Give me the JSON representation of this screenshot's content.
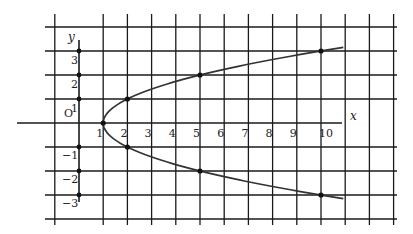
{
  "chart_data": {
    "type": "line",
    "title": "",
    "equation": "x = y^2 + 1",
    "xlabel": "x",
    "ylabel": "y",
    "origin_label": "O",
    "xlim": [
      -1,
      13
    ],
    "ylim": [
      -4,
      4
    ],
    "grid": true,
    "x_ticks": [
      1,
      2,
      3,
      4,
      5,
      6,
      7,
      8,
      9,
      10
    ],
    "x_tick_labels": [
      "1",
      "2",
      "3",
      "4",
      "5",
      "6",
      "7",
      "8",
      "9",
      "10"
    ],
    "y_ticks": [
      3,
      2,
      1,
      -1,
      -2,
      -3
    ],
    "y_tick_labels": [
      "3",
      "2",
      "1",
      "−1",
      "−2",
      "−3"
    ],
    "series": [
      {
        "name": "x = y^2 + 1",
        "points": [
          [
            1,
            0
          ],
          [
            2,
            1
          ],
          [
            2,
            -1
          ],
          [
            5,
            2
          ],
          [
            5,
            -2
          ],
          [
            10,
            3
          ],
          [
            10,
            -3
          ]
        ],
        "curve_y_range": [
          -3.15,
          3.15
        ]
      }
    ],
    "axis_points": [
      [
        0,
        1
      ],
      [
        0,
        2
      ],
      [
        0,
        3
      ],
      [
        0,
        -1
      ],
      [
        0,
        -2
      ],
      [
        0,
        -3
      ]
    ]
  }
}
